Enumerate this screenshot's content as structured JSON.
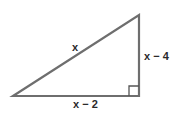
{
  "diagram": {
    "type": "right-triangle",
    "stroke_color": "#6e6e6e",
    "vertices": {
      "left": [
        13,
        96
      ],
      "top": [
        139,
        15
      ],
      "right_angle": [
        139,
        96
      ]
    },
    "right_angle_marker": {
      "size": 10,
      "position": "bottom-right"
    },
    "labels": {
      "hypotenuse": "x",
      "vertical_leg": "x − 4",
      "horizontal_leg": "x − 2"
    }
  }
}
